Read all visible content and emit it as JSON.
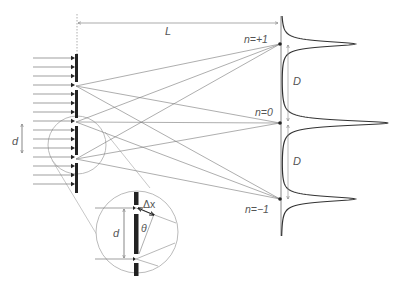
{
  "figure": {
    "colors": {
      "ray": "#777777",
      "grating": "#222222",
      "curve": "#333333",
      "magnifier": "#bbbbbb",
      "label": "#555555"
    }
  },
  "labels": {
    "distance": "L",
    "period_left": "d",
    "period_inset": "d",
    "separation_top": "D",
    "separation_bottom": "D",
    "order_plus": "n=+1",
    "order_zero": "n=0",
    "order_minus": "n=−1",
    "path_difference": "Δx",
    "angle": "θ"
  },
  "screen": {
    "x": 281,
    "top": 16,
    "bottom": 236,
    "orders": [
      {
        "n": "+1",
        "y": 44,
        "peak_x": 355
      },
      {
        "n": "0",
        "y": 123,
        "peak_x": 388
      },
      {
        "n": "-1",
        "y": 199,
        "peak_x": 355
      }
    ]
  },
  "grating": {
    "x": 76,
    "slits_y": [
      86,
      122,
      159
    ],
    "incident_rays": 15
  }
}
